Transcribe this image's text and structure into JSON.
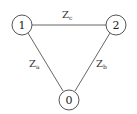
{
  "diagram": {
    "type": "delta-impedance-network",
    "nodes": [
      {
        "id": "1",
        "label": "1",
        "cx": 22,
        "cy": 25
      },
      {
        "id": "2",
        "label": "2",
        "cx": 116,
        "cy": 25
      },
      {
        "id": "0",
        "label": "0",
        "cx": 69,
        "cy": 100
      }
    ],
    "edges": [
      {
        "from": "1",
        "to": "2",
        "label": "Z",
        "sub": "c"
      },
      {
        "from": "1",
        "to": "0",
        "label": "Z",
        "sub": "a"
      },
      {
        "from": "2",
        "to": "0",
        "label": "Z",
        "sub": "b"
      }
    ],
    "colors": {
      "stroke": "#555555",
      "text": "#222222",
      "background": "#ffffff"
    }
  }
}
